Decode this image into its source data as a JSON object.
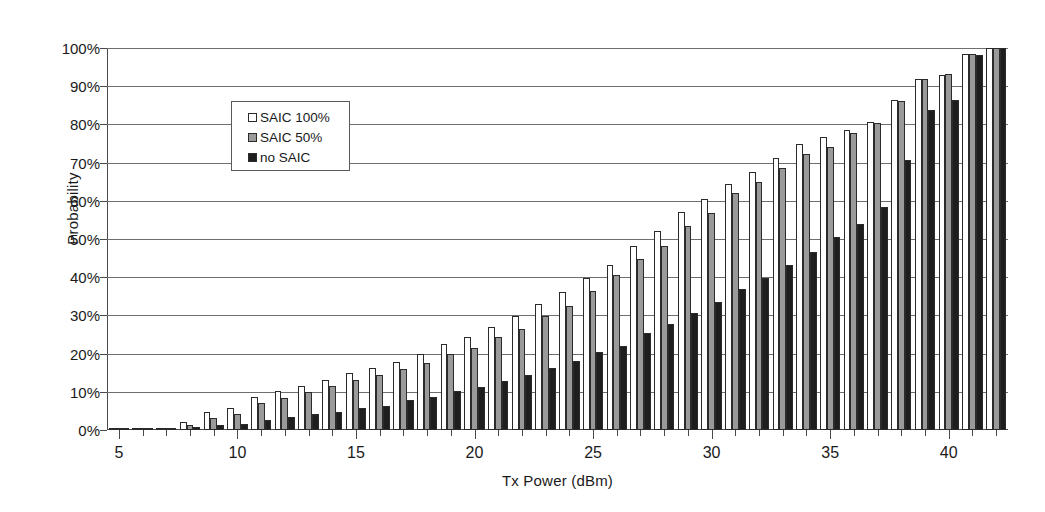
{
  "chart_data": {
    "type": "bar",
    "title": "",
    "xlabel": "Tx Power (dBm)",
    "ylabel": "Probability",
    "xlim": [
      4.5,
      42.5
    ],
    "ylim": [
      0,
      100
    ],
    "yunit": "%",
    "grid": true,
    "legend_position": "top-left-inside",
    "ytick_labels": [
      "0%",
      "10%",
      "20%",
      "30%",
      "40%",
      "50%",
      "60%",
      "70%",
      "80%",
      "90%",
      "100%"
    ],
    "ytick_values": [
      0,
      10,
      20,
      30,
      40,
      50,
      60,
      70,
      80,
      90,
      100
    ],
    "xtick_labels": [
      "5",
      "10",
      "15",
      "20",
      "25",
      "30",
      "35",
      "40"
    ],
    "xtick_values": [
      5,
      10,
      15,
      20,
      25,
      30,
      35,
      40
    ],
    "categories": [
      5,
      6,
      7,
      8,
      9,
      10,
      11,
      12,
      13,
      14,
      15,
      16,
      17,
      18,
      19,
      20,
      21,
      22,
      23,
      24,
      25,
      26,
      27,
      28,
      29,
      30,
      31,
      32,
      33,
      34,
      35,
      36,
      37,
      38,
      39,
      40,
      41,
      42
    ],
    "series": [
      {
        "name": "SAIC 100%",
        "color": "#ffffff",
        "values": [
          0.3,
          0.4,
          0.6,
          2.0,
          4.6,
          5.8,
          8.6,
          10.3,
          11.6,
          13.2,
          14.8,
          16.3,
          17.9,
          20.0,
          22.6,
          24.4,
          27.0,
          29.8,
          32.9,
          36.2,
          39.8,
          43.2,
          48.3,
          52.0,
          57.0,
          60.4,
          64.5,
          67.5,
          71.2,
          75.0,
          76.6,
          78.5,
          80.6,
          86.3,
          92.0,
          93.0,
          98.5,
          100.0
        ]
      },
      {
        "name": "SAIC 50%",
        "color": "#9a9a9a",
        "values": [
          0.2,
          0.3,
          0.4,
          1.4,
          3.1,
          4.3,
          7.1,
          8.5,
          10.0,
          11.4,
          13.0,
          14.5,
          16.1,
          17.6,
          20.0,
          21.5,
          24.3,
          26.4,
          29.8,
          32.5,
          36.3,
          40.6,
          44.8,
          48.2,
          53.4,
          56.8,
          62.0,
          65.0,
          68.5,
          72.3,
          74.0,
          77.8,
          80.4,
          86.0,
          92.0,
          93.3,
          98.5,
          100.0
        ]
      },
      {
        "name": "no SAIC",
        "color": "#1e1e1e",
        "values": [
          0.1,
          0.1,
          0.2,
          0.7,
          1.3,
          1.5,
          2.7,
          3.3,
          4.2,
          4.8,
          5.7,
          6.4,
          7.8,
          8.7,
          10.3,
          11.3,
          12.8,
          14.3,
          16.3,
          18.1,
          20.4,
          22.0,
          25.3,
          27.7,
          30.6,
          33.6,
          36.8,
          39.7,
          43.3,
          46.5,
          50.5,
          53.8,
          58.4,
          70.8,
          83.8,
          86.5,
          98.2,
          100.0
        ]
      }
    ]
  },
  "legend": {
    "items": [
      {
        "label": "SAIC 100%"
      },
      {
        "label": "SAIC 50%"
      },
      {
        "label": "no SAIC"
      }
    ]
  }
}
